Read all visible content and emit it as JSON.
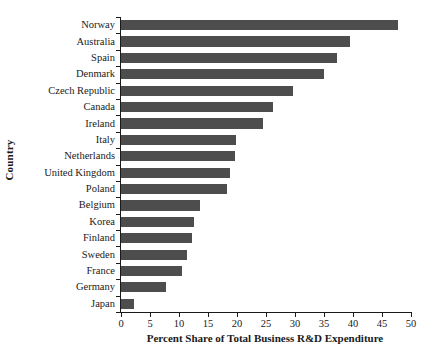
{
  "chart_data": {
    "type": "bar",
    "orientation": "horizontal",
    "title": "",
    "xlabel": "Percent Share of Total Business R&D Expenditure",
    "ylabel": "Country",
    "xlim": [
      0,
      50
    ],
    "xticks": [
      0,
      5,
      10,
      15,
      20,
      25,
      30,
      35,
      40,
      45,
      50
    ],
    "grid": false,
    "legend": null,
    "bar_color": "#4d4d4d",
    "axis_color": "#1a1a1a",
    "background": "#ffffff",
    "categories": [
      "Norway",
      "Australia",
      "Spain",
      "Denmark",
      "Czech Republic",
      "Canada",
      "Ireland",
      "Italy",
      "Netherlands",
      "United Kingdom",
      "Poland",
      "Belgium",
      "Korea",
      "Finland",
      "Sweden",
      "France",
      "Germany",
      "Japan"
    ],
    "values": [
      47.8,
      39.5,
      37.3,
      35.0,
      29.7,
      26.2,
      24.4,
      19.8,
      19.6,
      18.8,
      18.2,
      13.6,
      12.6,
      12.3,
      11.4,
      10.5,
      7.8,
      2.2
    ]
  }
}
